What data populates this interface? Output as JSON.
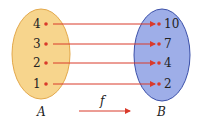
{
  "diagram": {
    "type": "function-mapping",
    "sets": {
      "domain": {
        "name": "A",
        "elements": [
          "4",
          "3",
          "2",
          "1"
        ],
        "fill": "#f7d58d",
        "stroke": "#e3a84a"
      },
      "codomain": {
        "name": "B",
        "elements": [
          "10",
          "7",
          "4",
          "2"
        ],
        "fill": "#9eaee8",
        "stroke": "#3a4fa8"
      }
    },
    "mappings": [
      {
        "from": "4",
        "to": "10"
      },
      {
        "from": "3",
        "to": "7"
      },
      {
        "from": "2",
        "to": "4"
      },
      {
        "from": "1",
        "to": "2"
      }
    ],
    "function_label": "f",
    "arrow_color": "#d93a2b"
  }
}
